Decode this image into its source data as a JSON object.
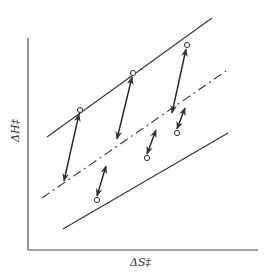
{
  "diagram": {
    "type": "enthalpy-entropy compensation plot",
    "x_axis_label": "ΔS‡",
    "y_axis_label": "ΔH‡",
    "colors": {
      "line": "#333333",
      "background": "#ffffff"
    },
    "axes": {
      "origin": [
        28,
        250
      ],
      "y_top": 38,
      "x_right": 258
    },
    "lines": [
      {
        "name": "upper-solid-line",
        "style": "solid",
        "from": [
          47,
          137
        ],
        "to": [
          212,
          18
        ]
      },
      {
        "name": "middle-dashed-line",
        "style": "dash-dot",
        "from": [
          42,
          198
        ],
        "to": [
          226,
          71
        ]
      },
      {
        "name": "lower-solid-line",
        "style": "solid",
        "from": [
          63,
          229
        ],
        "to": [
          228,
          133
        ]
      }
    ],
    "points": [
      {
        "name": "upper-point-1",
        "at": [
          80,
          110
        ]
      },
      {
        "name": "upper-point-2",
        "at": [
          133,
          73
        ]
      },
      {
        "name": "upper-point-3",
        "at": [
          187,
          45
        ]
      },
      {
        "name": "lower-point-1",
        "at": [
          97,
          200
        ]
      },
      {
        "name": "lower-point-2",
        "at": [
          147,
          158
        ]
      },
      {
        "name": "lower-point-3",
        "at": [
          177,
          133
        ]
      }
    ],
    "arrows": [
      {
        "name": "arrow-up-1",
        "from": [
          64,
          181
        ],
        "to": [
          79,
          114
        ]
      },
      {
        "name": "arrow-up-2",
        "from": [
          117,
          139
        ],
        "to": [
          132,
          77
        ]
      },
      {
        "name": "arrow-up-3",
        "from": [
          150,
          111
        ],
        "to": [
          186,
          49
        ]
      },
      {
        "name": "arrow-down-1",
        "from": [
          110,
          159
        ],
        "to": [
          97,
          196
        ]
      },
      {
        "name": "arrow-down-2",
        "from": [
          155,
          128
        ],
        "to": [
          147,
          154
        ]
      },
      {
        "name": "arrow-down-3",
        "from": [
          185,
          100
        ],
        "to": [
          177,
          129
        ]
      }
    ]
  }
}
